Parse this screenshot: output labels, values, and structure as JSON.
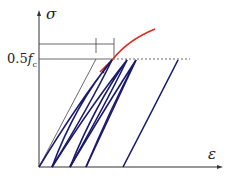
{
  "diagram": {
    "y_axis_label": "σ",
    "x_axis_label": "ε",
    "level_label_main": "0.5",
    "level_label_f": "f",
    "level_label_sub": "c",
    "colors": {
      "axis": "#333333",
      "envelope": "#e0281e",
      "loops": "#1a1a6e",
      "reference": "#444444"
    }
  }
}
